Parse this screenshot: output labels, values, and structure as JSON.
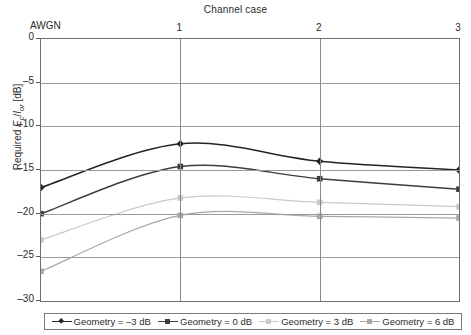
{
  "chart_data": {
    "type": "line",
    "title": "Channel case",
    "xlabel": "",
    "ylabel": "Required Ec/Ior [dB]",
    "ylabel_parts": {
      "prefix": "Required ",
      "num": "E",
      "num_sub": "c",
      "slash": "/",
      "den": "I",
      "den_sub": "or",
      "unit": " [dB]"
    },
    "x_categories": [
      "AWGN",
      "1",
      "2",
      "3"
    ],
    "x_tick_labels": [
      "1",
      "2",
      "3"
    ],
    "corner_label": "AWGN",
    "xlim": [
      0,
      3
    ],
    "ylim": [
      -30,
      0
    ],
    "y_ticks": [
      0,
      -5,
      -10,
      -15,
      -20,
      -25,
      -30
    ],
    "y_tick_labels": [
      "0",
      "-5",
      "-10",
      "-15",
      "-20",
      "-25",
      "-30"
    ],
    "grid": true,
    "legend_position": "bottom",
    "series": [
      {
        "name": "Geometry = -3 dB",
        "color": "#242424",
        "marker": "diamond",
        "values": [
          -17.0,
          -12.0,
          -14.0,
          -15.0
        ]
      },
      {
        "name": "Geometry = 0 dB",
        "color": "#3d3d3d",
        "marker": "square",
        "values": [
          -20.0,
          -14.6,
          -16.0,
          -17.2
        ]
      },
      {
        "name": "Geometry = 3 dB",
        "color": "#c9c9c9",
        "marker": "square",
        "values": [
          -23.0,
          -18.2,
          -18.7,
          -19.2
        ]
      },
      {
        "name": "Geometry = 6 dB",
        "color": "#a8a8a8",
        "marker": "square",
        "values": [
          -26.6,
          -20.2,
          -20.3,
          -20.5
        ]
      }
    ]
  },
  "legend": {
    "items": [
      {
        "label": "Geometry = –3 dB",
        "color": "#242424",
        "marker": "diamond"
      },
      {
        "label": "Geometry = 0 dB",
        "color": "#3d3d3d",
        "marker": "square"
      },
      {
        "label": "Geometry = 3 dB",
        "color": "#c9c9c9",
        "marker": "square"
      },
      {
        "label": "Geometry = 6 dB",
        "color": "#a8a8a8",
        "marker": "square"
      }
    ]
  }
}
